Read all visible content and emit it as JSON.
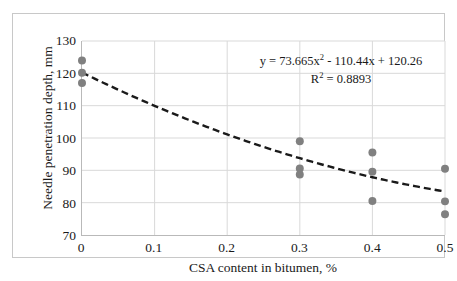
{
  "chart_data": {
    "type": "scatter",
    "title": "",
    "xlabel": "CSA content in bitumen, %",
    "ylabel": "Needle penetration depth, mm",
    "xlim": [
      0,
      0.5
    ],
    "ylim": [
      70,
      130
    ],
    "xticks": [
      "0",
      "0.1",
      "0.2",
      "0.3",
      "0.4",
      "0.5"
    ],
    "xtick_values": [
      0,
      0.1,
      0.2,
      0.3,
      0.4,
      0.5
    ],
    "yticks": [
      "70",
      "80",
      "90",
      "100",
      "110",
      "120",
      "130"
    ],
    "ytick_values": [
      70,
      80,
      90,
      100,
      110,
      120,
      130
    ],
    "grid": true,
    "grid_x": true,
    "grid_y": true,
    "legend": false,
    "marker": "circle",
    "marker_color": "#808080",
    "marker_size": 7,
    "series": [
      {
        "name": "Needle penetration depth",
        "points": [
          {
            "x": 0.0,
            "y": 124.0
          },
          {
            "x": 0.0,
            "y": 120.2
          },
          {
            "x": 0.0,
            "y": 117.0
          },
          {
            "x": 0.3,
            "y": 99.0
          },
          {
            "x": 0.3,
            "y": 90.6
          },
          {
            "x": 0.3,
            "y": 88.7
          },
          {
            "x": 0.4,
            "y": 95.5
          },
          {
            "x": 0.4,
            "y": 89.6
          },
          {
            "x": 0.4,
            "y": 80.5
          },
          {
            "x": 0.5,
            "y": 90.5
          },
          {
            "x": 0.5,
            "y": 80.4
          },
          {
            "x": 0.5,
            "y": 76.4
          }
        ]
      }
    ],
    "trendline": {
      "type": "polynomial",
      "order": 2,
      "style": "dashed",
      "color": "#1a1a1a",
      "coefficients": {
        "a": 73.665,
        "b": -110.44,
        "c": 120.26
      },
      "equation_text": "y = 73.665x",
      "equation_exp": "2",
      "equation_tail": " - 110.44x + 120.26",
      "r_squared_label": "R",
      "r_squared_exp": "2",
      "r_squared_value": " = 0.8893"
    }
  },
  "colors": {
    "marker": "#808080",
    "trend": "#1a1a1a",
    "gridline": "#d9d9d9",
    "axis": "#b9b9b9",
    "frame_border": "#c8c8c8",
    "text": "#1a1a1a",
    "background": "#ffffff"
  }
}
